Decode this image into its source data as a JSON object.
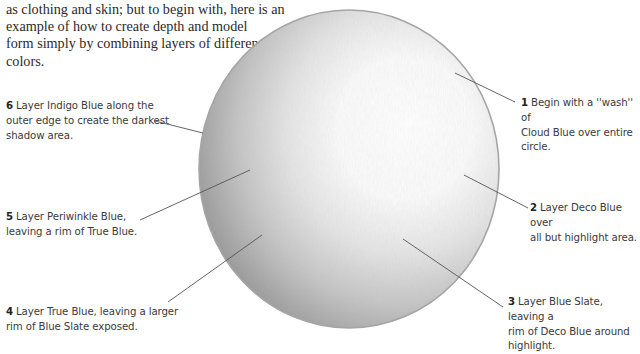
{
  "intro": {
    "partial_top_line": "clothing and skin is explained in later chapters, but to begin with, such",
    "lines": [
      "as clothing and skin; but to begin with, here is an",
      "example of how to create depth and model",
      "form simply by combining layers of different",
      "colors."
    ]
  },
  "illustration": {
    "subject": "pencil-shaded sphere",
    "colors": {
      "outline": "#9a9a9a",
      "shadow": "#8c8c8c",
      "highlight": "#ffffff",
      "leader_line": "#555555"
    }
  },
  "steps": [
    {
      "number": "1",
      "lines": [
        "Begin with a ''wash'' of",
        "Cloud Blue over entire",
        "circle."
      ]
    },
    {
      "number": "2",
      "lines": [
        "Layer Deco Blue over",
        "all but highlight area."
      ]
    },
    {
      "number": "3",
      "lines": [
        "Layer Blue Slate, leaving a",
        "rim of Deco Blue around",
        "highlight."
      ]
    },
    {
      "number": "4",
      "lines": [
        "Layer True Blue, leaving a larger",
        "rim of Blue Slate exposed."
      ]
    },
    {
      "number": "5",
      "lines": [
        "Layer Periwinkle Blue,",
        "leaving a rim of True Blue."
      ]
    },
    {
      "number": "6",
      "lines": [
        "Layer Indigo Blue along the",
        "outer edge to create the darkest",
        "shadow area."
      ]
    }
  ]
}
